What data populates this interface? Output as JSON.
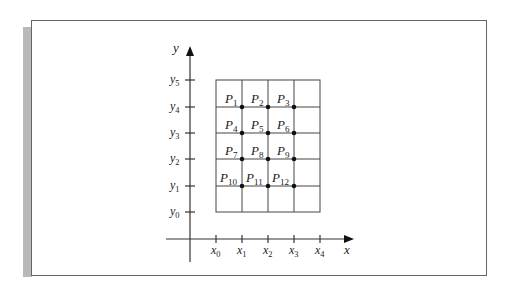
{
  "diagram": {
    "type": "grid-points",
    "axes": {
      "x_label": "x",
      "y_label": "y"
    },
    "x_ticks": [
      "x0",
      "x1",
      "x2",
      "x3",
      "x4"
    ],
    "y_ticks": [
      "y0",
      "y1",
      "y2",
      "y3",
      "y4",
      "y5"
    ],
    "points": [
      {
        "label": "P",
        "sub": "1",
        "xi": 1,
        "yi": 4
      },
      {
        "label": "P",
        "sub": "2",
        "xi": 2,
        "yi": 4
      },
      {
        "label": "P",
        "sub": "3",
        "xi": 3,
        "yi": 4
      },
      {
        "label": "P",
        "sub": "4",
        "xi": 1,
        "yi": 3
      },
      {
        "label": "P",
        "sub": "5",
        "xi": 2,
        "yi": 3
      },
      {
        "label": "P",
        "sub": "6",
        "xi": 3,
        "yi": 3
      },
      {
        "label": "P",
        "sub": "7",
        "xi": 1,
        "yi": 2
      },
      {
        "label": "P",
        "sub": "8",
        "xi": 2,
        "yi": 2
      },
      {
        "label": "P",
        "sub": "9",
        "xi": 3,
        "yi": 2
      },
      {
        "label": "P",
        "sub": "10",
        "xi": 1,
        "yi": 1
      },
      {
        "label": "P",
        "sub": "11",
        "xi": 2,
        "yi": 1
      },
      {
        "label": "P",
        "sub": "12",
        "xi": 3,
        "yi": 1
      }
    ]
  }
}
